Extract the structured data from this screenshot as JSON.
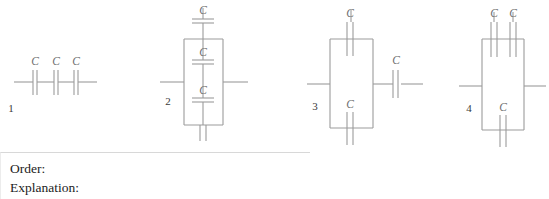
{
  "figure": {
    "caption_labels": [
      "1",
      "2",
      "3",
      "4"
    ],
    "capacitor_symbol_label": "C",
    "circuits": [
      {
        "id": "1",
        "number_label": "1",
        "description": "three capacitors in series on a single horizontal wire",
        "capacitor_labels": [
          "C",
          "C",
          "C"
        ],
        "capacitor_count": 3
      },
      {
        "id": "2",
        "number_label": "2",
        "description": "vertical loop with a capacitor on the top branch, a capacitor on the middle vertical branch, and a capacitor on the bottom branch",
        "capacitor_labels": [
          "C",
          "C",
          "C"
        ],
        "capacitor_count": 3
      },
      {
        "id": "3",
        "number_label": "3",
        "description": "loop with a capacitor on the top branch and one on the bottom branch, followed by a capacitor in series on the right lead",
        "capacitor_labels": [
          "C",
          "C",
          "C"
        ],
        "capacitor_count": 3
      },
      {
        "id": "4",
        "number_label": "4",
        "description": "loop with two capacitors in parallel on the top branch and one capacitor on the bottom branch",
        "capacitor_labels": [
          "C",
          "C",
          "C"
        ],
        "capacitor_count": 3
      }
    ]
  },
  "answer": {
    "order_label": "Order:",
    "order_value": "",
    "explanation_label": "Explanation:",
    "explanation_value": ""
  },
  "colors": {
    "wire": "#9b9b9b",
    "cap_label": "#6f6f6f",
    "circuit_number": "#3a3a3a",
    "text": "#1c1c1c",
    "box_border_top": "#d8d8d8",
    "box_border_left": "#ececec",
    "background": "#ffffff"
  }
}
